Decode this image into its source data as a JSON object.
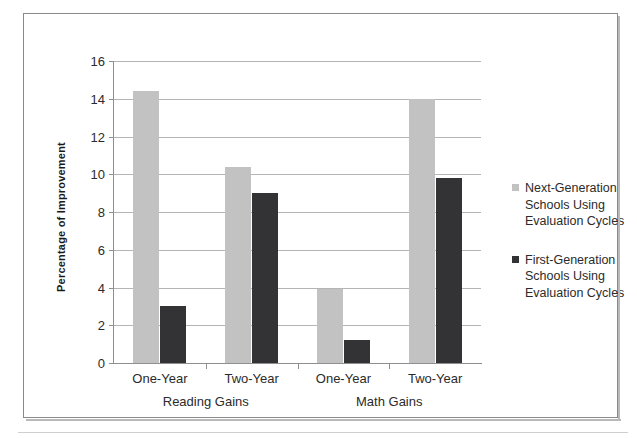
{
  "chart_data": {
    "type": "bar",
    "title": "",
    "xlabel": "",
    "ylabel": "Percentage of Improvement",
    "ylim": [
      0,
      16
    ],
    "yticks": [
      0,
      2,
      4,
      6,
      8,
      10,
      12,
      14,
      16
    ],
    "grid": true,
    "legend_position": "right",
    "categories": [
      "One-Year",
      "Two-Year",
      "One-Year",
      "Two-Year"
    ],
    "groups": [
      {
        "name": "Reading Gains",
        "categories": [
          "One-Year",
          "Two-Year"
        ]
      },
      {
        "name": "Math Gains",
        "categories": [
          "One-Year",
          "Two-Year"
        ]
      }
    ],
    "series": [
      {
        "name": "Next-Generation Schools Using Evaluation Cycles",
        "color": "#c2c2c2",
        "values": [
          14.4,
          10.4,
          3.9,
          14.0
        ]
      },
      {
        "name": "First-Generation Schools Using Evaluation Cycles",
        "color": "#333335",
        "values": [
          3.0,
          9.0,
          1.2,
          9.8
        ]
      }
    ]
  },
  "legend": {
    "entries": [
      {
        "swatch": "light",
        "lines": [
          "Next-Generation",
          "Schools Using",
          "Evaluation Cycles"
        ]
      },
      {
        "swatch": "dark",
        "lines": [
          "First-Generation",
          "Schools Using",
          "Evaluation Cycles"
        ]
      }
    ]
  }
}
